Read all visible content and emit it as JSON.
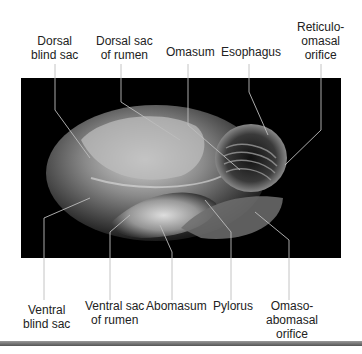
{
  "diagram": {
    "top_labels": [
      {
        "id": "dorsal-blind-sac",
        "lines": [
          "Dorsal",
          "blind sac"
        ]
      },
      {
        "id": "dorsal-sac-of-rumen",
        "lines": [
          "Dorsal sac",
          "of rumen"
        ]
      },
      {
        "id": "omasum",
        "lines": [
          "Omasum"
        ]
      },
      {
        "id": "esophagus",
        "lines": [
          "Esophagus"
        ]
      },
      {
        "id": "reticulo-omasal-orifice",
        "lines": [
          "Reticulo-",
          "omasal",
          "orifice"
        ]
      }
    ],
    "bottom_labels": [
      {
        "id": "ventral-blind-sac",
        "lines": [
          "Ventral",
          "blind sac"
        ]
      },
      {
        "id": "ventral-sac-of-rumen",
        "lines": [
          "Ventral sac",
          "of rumen"
        ]
      },
      {
        "id": "abomasum",
        "lines": [
          "Abomasum"
        ]
      },
      {
        "id": "pylorus",
        "lines": [
          "Pylorus"
        ]
      },
      {
        "id": "omaso-abomasal-orifice",
        "lines": [
          "Omaso-",
          "abomasal",
          "orifice"
        ]
      }
    ]
  },
  "colors": {
    "background": "#ffffff",
    "photo_background": "#000000",
    "leader_line": "#bdbdbd",
    "label_text": "#222222"
  }
}
